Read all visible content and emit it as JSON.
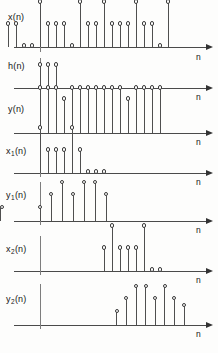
{
  "figure": {
    "title": "",
    "axis_label": "n",
    "stem_head_style": "open-circle",
    "colors": {
      "stem": "#4f4f4f",
      "axis": "#4a4a4a",
      "vaxis": "#7d7d7d",
      "background": "#fdfdfc"
    }
  },
  "chart_data": {
    "type": "line",
    "xlabel": "n",
    "ylabel": "",
    "grid": false,
    "legend_position": "none",
    "panels": [
      {
        "id": "x",
        "label": "x (n)",
        "label_base": "x",
        "label_sub": "",
        "label_tail": "(n)",
        "xlabel": "n",
        "n_start": -4,
        "n": [
          -4,
          -3,
          -2,
          -1,
          0,
          1,
          2,
          3,
          4,
          5,
          6,
          7,
          8,
          9,
          10,
          11,
          12,
          13,
          14,
          15,
          16
        ],
        "values": [
          1,
          1,
          0,
          0,
          2,
          1,
          1,
          1,
          0,
          2,
          1,
          1,
          2,
          1,
          1,
          1,
          2,
          1,
          1,
          0,
          2
        ],
        "ylim": [
          0,
          2.2
        ]
      },
      {
        "id": "h",
        "label": "h (n)",
        "label_base": "h",
        "label_sub": "",
        "label_tail": "(n)",
        "xlabel": "n",
        "n_start": 0,
        "n": [
          0,
          1,
          2
        ],
        "values": [
          1,
          1,
          1
        ],
        "ylim": [
          0,
          2.2
        ]
      },
      {
        "id": "y",
        "label": "y (n)",
        "label_base": "y",
        "label_sub": "",
        "label_tail": "(n)",
        "xlabel": "n",
        "n_start": 0,
        "n": [
          0,
          1,
          2,
          3,
          4,
          5,
          6,
          7,
          8,
          9,
          10,
          11,
          12,
          13,
          14,
          15
        ],
        "values": [
          2,
          2,
          2,
          1.5,
          2,
          2,
          2,
          2,
          2,
          2,
          2,
          1.5,
          2,
          2,
          2,
          2
        ],
        "ylim": [
          0,
          2.2
        ]
      },
      {
        "id": "x1",
        "label": "x₁(n)",
        "label_base": "x",
        "label_sub": "1",
        "label_tail": "(n)",
        "xlabel": "n",
        "n_start": 0,
        "n": [
          0,
          1,
          2,
          3,
          4,
          5,
          6,
          7,
          8
        ],
        "values": [
          2,
          1,
          1,
          1,
          2,
          1,
          0,
          0,
          0
        ],
        "ylim": [
          0,
          2.2
        ]
      },
      {
        "id": "y1",
        "label": "y₁(n)",
        "label_base": "y",
        "label_sub": "1",
        "label_tail": "(n)",
        "xlabel": "n",
        "n_start": 0,
        "n": [
          0,
          1,
          2,
          3,
          4,
          5,
          6
        ],
        "values": [
          1,
          2,
          3,
          2,
          3,
          3,
          2,
          1
        ],
        "ylim": [
          0,
          3.4
        ]
      },
      {
        "id": "x2",
        "label": "x₂(n)",
        "label_base": "x",
        "label_sub": "2",
        "label_tail": "(n)",
        "xlabel": "n",
        "n_start": 8,
        "n": [
          8,
          9,
          10,
          11,
          12,
          13,
          14,
          15
        ],
        "values": [
          1,
          2,
          1,
          1,
          1,
          2,
          0,
          0
        ],
        "ylim": [
          0,
          2.2
        ]
      },
      {
        "id": "y2",
        "label": "y₂(n)",
        "label_base": "y",
        "label_sub": "2",
        "label_tail": "(n)",
        "xlabel": "n",
        "n_start": 8,
        "n": [
          8,
          9,
          10,
          11,
          12,
          13,
          14,
          15
        ],
        "values": [
          1,
          2,
          3,
          3,
          2,
          3,
          2,
          1.5
        ],
        "ylim": [
          0,
          3.4
        ]
      }
    ]
  }
}
